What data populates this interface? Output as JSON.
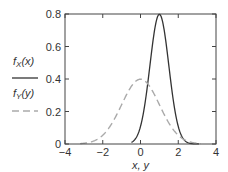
{
  "chart_data": {
    "type": "line",
    "title": "",
    "xlabel": "x, y",
    "ylabel": "",
    "xlim": [
      -4,
      4
    ],
    "ylim": [
      0,
      0.8
    ],
    "xticks": [
      -4,
      -2,
      0,
      2,
      4
    ],
    "xtick_labels": [
      "−4",
      "−2",
      "0",
      "2",
      "4"
    ],
    "yticks": [
      0,
      0.2,
      0.4,
      0.6,
      0.8
    ],
    "ytick_labels": [
      "0",
      "0.2",
      "0.4",
      "0.6",
      "0.8"
    ],
    "grid": false,
    "legend_position": "left",
    "series": [
      {
        "name": "fX(x)",
        "style": "solid",
        "color": "#333333",
        "mean": 1,
        "std": 0.5,
        "peak": 0.8,
        "x": [
          -1,
          0,
          0.5,
          1,
          1.5,
          2,
          3
        ],
        "y": [
          0.0,
          0.11,
          0.48,
          0.8,
          0.48,
          0.11,
          0.0
        ]
      },
      {
        "name": "fY(y)",
        "style": "dashed",
        "color": "#aaaaaa",
        "mean": 0,
        "std": 1,
        "peak": 0.4,
        "x": [
          -3,
          -2,
          -1,
          0,
          1,
          2,
          3
        ],
        "y": [
          0.004,
          0.054,
          0.242,
          0.399,
          0.242,
          0.054,
          0.004
        ]
      }
    ]
  },
  "legend": {
    "fx_label": "fX(x)",
    "fy_label": "fY(y)"
  }
}
